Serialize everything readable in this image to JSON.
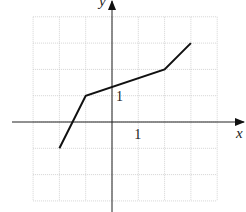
{
  "chart_data": {
    "type": "line",
    "title": "",
    "xlabel": "x",
    "ylabel": "y",
    "xlim": [
      -3,
      4
    ],
    "ylim": [
      -3,
      4
    ],
    "grid": true,
    "tick_labels": {
      "x": [
        "1"
      ],
      "y": [
        "1"
      ]
    },
    "series": [
      {
        "name": "f(x)",
        "points": [
          [
            -2,
            -1
          ],
          [
            -1,
            1
          ],
          [
            2,
            2
          ],
          [
            3,
            3
          ]
        ]
      }
    ]
  },
  "labels": {
    "x_axis": "x",
    "y_axis": "y",
    "x_tick_one": "1",
    "y_tick_one": "1"
  }
}
